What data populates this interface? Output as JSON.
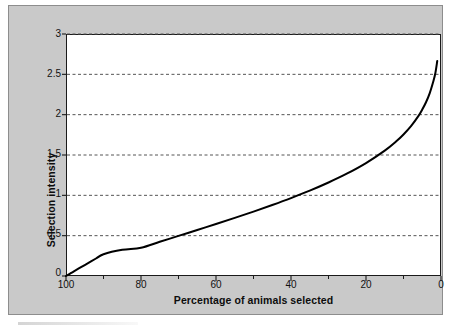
{
  "chart_data": {
    "type": "line",
    "title": "",
    "xlabel": "Percentage of animals selected",
    "ylabel": "Selection intensity",
    "xlim": [
      100,
      0
    ],
    "ylim": [
      0,
      3
    ],
    "x_reversed": true,
    "grid": "horizontal-dashed",
    "legend": null,
    "xticks": [
      100,
      80,
      60,
      40,
      20,
      0
    ],
    "xtick_labels": [
      "100",
      "80",
      "60",
      "40",
      "20",
      "0"
    ],
    "x_minor_ticks": [
      90,
      70,
      50,
      30,
      10
    ],
    "yticks": [
      0,
      0.5,
      1,
      1.5,
      2,
      2.5,
      3
    ],
    "ytick_labels": [
      "0",
      "0.5",
      "1",
      "1.5",
      "2",
      "2.5",
      "3"
    ],
    "series": [
      {
        "name": "Selection intensity",
        "color": "#000000",
        "linewidth": 2,
        "x": [
          100,
          99,
          98,
          96,
          94,
          92,
          90,
          85,
          80,
          75,
          70,
          65,
          60,
          55,
          50,
          45,
          40,
          35,
          30,
          25,
          20,
          15,
          12,
          10,
          8,
          6,
          5,
          4,
          3,
          2,
          1.5,
          1
        ],
        "y": [
          0.0,
          0.027,
          0.055,
          0.109,
          0.163,
          0.217,
          0.27,
          0.324,
          0.35,
          0.424,
          0.497,
          0.571,
          0.644,
          0.72,
          0.798,
          0.88,
          0.966,
          1.058,
          1.159,
          1.271,
          1.4,
          1.554,
          1.667,
          1.755,
          1.858,
          1.985,
          2.063,
          2.154,
          2.268,
          2.421,
          2.517,
          2.665
        ]
      }
    ]
  },
  "axes": {
    "y_labels": [
      "3",
      "2.5",
      "2",
      "1.5",
      "1",
      "0.5",
      "0"
    ],
    "x_labels": [
      "100",
      "80",
      "60",
      "40",
      "20",
      "0"
    ]
  },
  "figure": {
    "panel_color": "#c9c9c9",
    "plot_background": "#ffffff",
    "curve_color": "#000000",
    "grid_color": "#555555",
    "axis_color": "#1a1a1a"
  }
}
